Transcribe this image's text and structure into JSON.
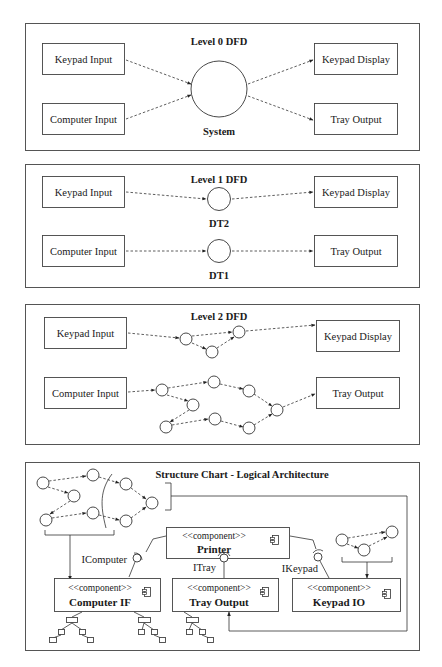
{
  "level0": {
    "title": "Level 0 DFD",
    "inputs": [
      "Keypad Input",
      "Computer Input"
    ],
    "process": "System",
    "outputs": [
      "Keypad Display",
      "Tray Output"
    ]
  },
  "level1": {
    "title": "Level 1 DFD",
    "inputs": [
      "Keypad Input",
      "Computer Input"
    ],
    "processes": [
      "DT2",
      "DT1"
    ],
    "outputs": [
      "Keypad Display",
      "Tray Output"
    ]
  },
  "level2": {
    "title": "Level 2 DFD",
    "inputs": [
      "Keypad Input",
      "Computer Input"
    ],
    "outputs": [
      "Keypad Display",
      "Tray Output"
    ]
  },
  "structure": {
    "title": "Structure Chart - Logical Architecture",
    "stereotype": "<<component>>",
    "components": [
      "Printer",
      "Computer IF",
      "Tray Output",
      "Keypad IO"
    ],
    "interfaces": [
      "IComputer",
      "ITray",
      "IKeypad"
    ],
    "component_icon": "component-icon"
  }
}
